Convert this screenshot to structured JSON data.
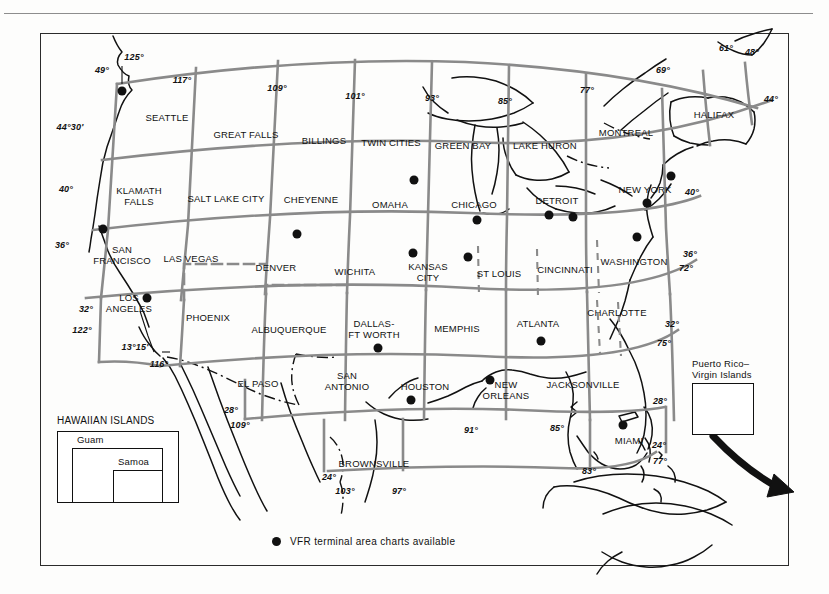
{
  "figure": {
    "type": "sectional-chart-index-map",
    "region": "Conterminous United States"
  },
  "legend": {
    "marker": "filled-circle",
    "text": "VFR terminal area charts available"
  },
  "charts": [
    {
      "name": "SEATTLE",
      "x": 167,
      "y": 118
    },
    {
      "name": "GREAT FALLS",
      "x": 246,
      "y": 135
    },
    {
      "name": "BILLINGS",
      "x": 324,
      "y": 141
    },
    {
      "name": "TWIN CITIES",
      "x": 391,
      "y": 143
    },
    {
      "name": "GREEN BAY",
      "x": 463,
      "y": 146
    },
    {
      "name": "LAKE HURON",
      "x": 545,
      "y": 146
    },
    {
      "name": "MONTREAL",
      "x": 626,
      "y": 133
    },
    {
      "name": "HALIFAX",
      "x": 714,
      "y": 115
    },
    {
      "name": "KLAMATH\nFALLS",
      "x": 139,
      "y": 196
    },
    {
      "name": "SALT LAKE CITY",
      "x": 226,
      "y": 199
    },
    {
      "name": "CHEYENNE",
      "x": 311,
      "y": 200
    },
    {
      "name": "OMAHA",
      "x": 390,
      "y": 205
    },
    {
      "name": "CHICAGO",
      "x": 474,
      "y": 205
    },
    {
      "name": "DETROIT",
      "x": 557,
      "y": 201
    },
    {
      "name": "NEW YORK",
      "x": 645,
      "y": 190
    },
    {
      "name": "SAN\nFRANCISCO",
      "x": 122,
      "y": 255
    },
    {
      "name": "LAS VEGAS",
      "x": 191,
      "y": 259
    },
    {
      "name": "DENVER",
      "x": 276,
      "y": 268
    },
    {
      "name": "WICHITA",
      "x": 355,
      "y": 272
    },
    {
      "name": "KANSAS\nCITY",
      "x": 428,
      "y": 272
    },
    {
      "name": "ST LOUIS",
      "x": 499,
      "y": 274
    },
    {
      "name": "CINCINNATI",
      "x": 565,
      "y": 270
    },
    {
      "name": "WASHINGTON",
      "x": 634,
      "y": 262
    },
    {
      "name": "LOS\nANGELES",
      "x": 129,
      "y": 303
    },
    {
      "name": "PHOENIX",
      "x": 208,
      "y": 318
    },
    {
      "name": "ALBUQUERQUE",
      "x": 289,
      "y": 330
    },
    {
      "name": "DALLAS-\nFT WORTH",
      "x": 374,
      "y": 329
    },
    {
      "name": "MEMPHIS",
      "x": 457,
      "y": 329
    },
    {
      "name": "ATLANTA",
      "x": 538,
      "y": 324
    },
    {
      "name": "CHARLOTTE",
      "x": 617,
      "y": 313
    },
    {
      "name": "EL PASO",
      "x": 258,
      "y": 384
    },
    {
      "name": "SAN\nANTONIO",
      "x": 347,
      "y": 381
    },
    {
      "name": "HOUSTON",
      "x": 425,
      "y": 387
    },
    {
      "name": "NEW\nORLEANS",
      "x": 506,
      "y": 390
    },
    {
      "name": "JACKSONVILLE",
      "x": 583,
      "y": 385
    },
    {
      "name": "MIAMI",
      "x": 629,
      "y": 441
    },
    {
      "name": "BROWNSVILLE",
      "x": 374,
      "y": 464
    }
  ],
  "terminal_area_markers": [
    {
      "city": "SEATTLE",
      "x": 122,
      "y": 91
    },
    {
      "city": "SAN FRANCISCO",
      "x": 103,
      "y": 229
    },
    {
      "city": "LOS ANGELES",
      "x": 147,
      "y": 298
    },
    {
      "city": "DENVER",
      "x": 297,
      "y": 234
    },
    {
      "city": "TWIN CITIES",
      "x": 414,
      "y": 180
    },
    {
      "city": "CHICAGO",
      "x": 477,
      "y": 220
    },
    {
      "city": "DETROIT",
      "x": 549,
      "y": 215
    },
    {
      "city": "DETROIT-2",
      "x": 573,
      "y": 217
    },
    {
      "city": "KANSAS CITY",
      "x": 413,
      "y": 253
    },
    {
      "city": "ST LOUIS",
      "x": 468,
      "y": 257
    },
    {
      "city": "NEW YORK",
      "x": 671,
      "y": 176
    },
    {
      "city": "NEW YORK-2",
      "x": 647,
      "y": 203
    },
    {
      "city": "WASHINGTON",
      "x": 637,
      "y": 237
    },
    {
      "city": "DALLAS-FT WORTH",
      "x": 378,
      "y": 348
    },
    {
      "city": "ATLANTA",
      "x": 541,
      "y": 341
    },
    {
      "city": "HOUSTON",
      "x": 411,
      "y": 400
    },
    {
      "city": "NEW ORLEANS",
      "x": 490,
      "y": 380
    },
    {
      "city": "MIAMI",
      "x": 623,
      "y": 425
    },
    {
      "city": "PUERTO RICO",
      "x": 724,
      "y": 400
    }
  ],
  "coordinates": [
    {
      "label": "125°",
      "x": 134,
      "y": 57
    },
    {
      "label": "49°",
      "x": 102,
      "y": 70
    },
    {
      "label": "117°",
      "x": 182,
      "y": 80
    },
    {
      "label": "109°",
      "x": 277,
      "y": 88
    },
    {
      "label": "101°",
      "x": 355,
      "y": 96
    },
    {
      "label": "93°",
      "x": 432,
      "y": 98
    },
    {
      "label": "85°",
      "x": 505,
      "y": 101
    },
    {
      "label": "77°",
      "x": 587,
      "y": 90
    },
    {
      "label": "69°",
      "x": 663,
      "y": 70
    },
    {
      "label": "61°",
      "x": 726,
      "y": 48
    },
    {
      "label": "48°",
      "x": 752,
      "y": 52
    },
    {
      "label": "44°",
      "x": 771,
      "y": 99
    },
    {
      "label": "44°30'",
      "x": 70,
      "y": 127
    },
    {
      "label": "40°",
      "x": 66,
      "y": 189
    },
    {
      "label": "40°",
      "x": 692,
      "y": 192
    },
    {
      "label": "36°",
      "x": 62,
      "y": 245
    },
    {
      "label": "36°",
      "x": 690,
      "y": 254
    },
    {
      "label": "72°",
      "x": 686,
      "y": 268
    },
    {
      "label": "32°",
      "x": 86,
      "y": 309
    },
    {
      "label": "122°",
      "x": 82,
      "y": 330
    },
    {
      "label": "13°15'",
      "x": 135,
      "y": 347
    },
    {
      "label": "116°",
      "x": 159,
      "y": 364
    },
    {
      "label": "32°",
      "x": 672,
      "y": 324
    },
    {
      "label": "75°",
      "x": 664,
      "y": 343
    },
    {
      "label": "28°",
      "x": 231,
      "y": 410
    },
    {
      "label": "109°",
      "x": 240,
      "y": 425
    },
    {
      "label": "28°",
      "x": 660,
      "y": 401
    },
    {
      "label": "91°",
      "x": 471,
      "y": 430
    },
    {
      "label": "85°",
      "x": 557,
      "y": 428
    },
    {
      "label": "24°",
      "x": 659,
      "y": 445
    },
    {
      "label": "77°",
      "x": 660,
      "y": 461
    },
    {
      "label": "24°",
      "x": 329,
      "y": 477
    },
    {
      "label": "103°",
      "x": 345,
      "y": 491
    },
    {
      "label": "97°",
      "x": 399,
      "y": 491
    },
    {
      "label": "83°",
      "x": 589,
      "y": 471
    }
  ],
  "insets": {
    "hawaii": {
      "title": "HAWAIIAN ISLANDS",
      "sub_labels": [
        "Guam",
        "Samoa"
      ]
    },
    "puerto_rico": {
      "title": "Puerto Rico–\nVirgin Islands",
      "title_line1": "Puerto Rico–",
      "title_line2": "Virgin Islands"
    }
  },
  "colors": {
    "grid": "#8a8a8a",
    "coast": "#111111",
    "text": "#111111",
    "frame": "#2b2b2b",
    "marker": "#111111"
  }
}
